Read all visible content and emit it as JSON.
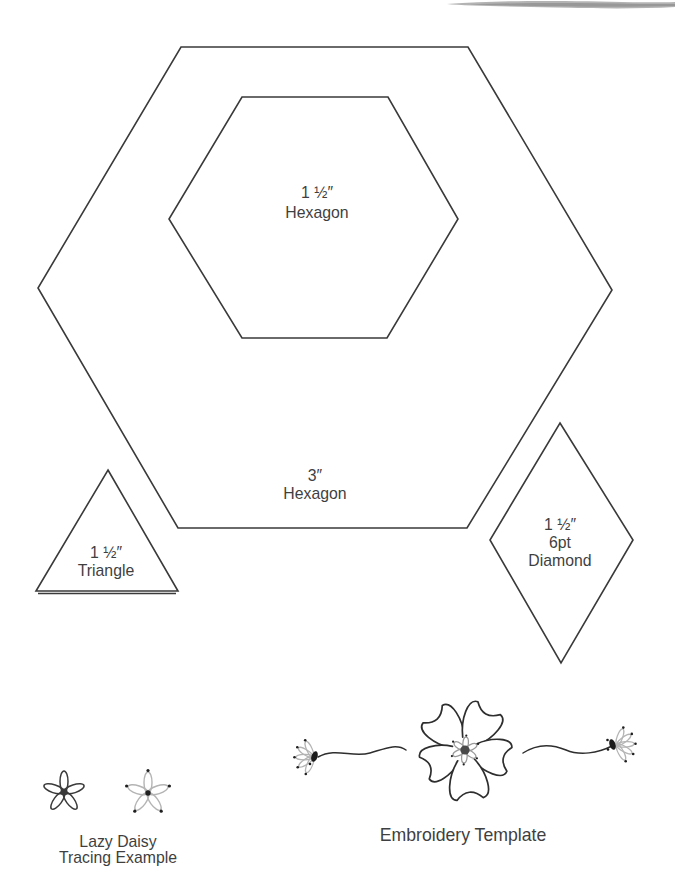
{
  "page": {
    "background": "#ffffff",
    "line_color": "#3a3a3a",
    "light_gray": "#b4b4b4",
    "smudge_color": "#a6a6a6"
  },
  "labels": {
    "small_hexagon": {
      "size": "1 ½″",
      "name": "Hexagon"
    },
    "large_hexagon": {
      "size": "3″",
      "name": "Hexagon"
    },
    "triangle": {
      "size": "1 ½″",
      "name": "Triangle"
    },
    "diamond": {
      "size": "1 ½″",
      "points": "6pt",
      "name": "Diamond"
    },
    "lazy_daisy": {
      "line1": "Lazy Daisy",
      "line2": "Tracing Example"
    },
    "embroidery": {
      "caption": "Embroidery Template"
    }
  }
}
